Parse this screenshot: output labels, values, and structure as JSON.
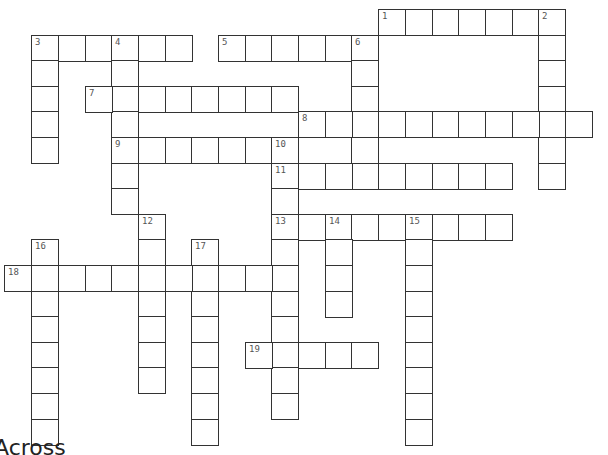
{
  "puzzle": {
    "layout": {
      "origin_x": 4.4,
      "origin_y": 9,
      "col_pitch": 26.7,
      "row_pitch": 25.6
    },
    "clues": [
      {
        "number": "1",
        "direction": "across",
        "row": 0,
        "col": 14,
        "length": 7
      },
      {
        "number": "2",
        "direction": "down",
        "row": 0,
        "col": 20,
        "length": 7
      },
      {
        "number": "3",
        "direction": "across",
        "row": 1,
        "col": 1,
        "length": 6
      },
      {
        "number": "3",
        "direction": "down",
        "row": 1,
        "col": 1,
        "length": 5
      },
      {
        "number": "4",
        "direction": "down",
        "row": 1,
        "col": 4,
        "length": 7
      },
      {
        "number": "5",
        "direction": "across",
        "row": 1,
        "col": 8,
        "length": 6
      },
      {
        "number": "6",
        "direction": "down",
        "row": 1,
        "col": 13,
        "length": 6
      },
      {
        "number": "7",
        "direction": "across",
        "row": 3,
        "col": 3,
        "length": 8
      },
      {
        "number": "8",
        "direction": "across",
        "row": 4,
        "col": 11,
        "length": 11
      },
      {
        "number": "9",
        "direction": "across",
        "row": 5,
        "col": 4,
        "length": 7
      },
      {
        "number": "10",
        "direction": "down",
        "row": 5,
        "col": 10,
        "length": 11
      },
      {
        "number": "11",
        "direction": "across",
        "row": 6,
        "col": 10,
        "length": 9
      },
      {
        "number": "12",
        "direction": "down",
        "row": 8,
        "col": 5,
        "length": 7
      },
      {
        "number": "13",
        "direction": "across",
        "row": 8,
        "col": 10,
        "length": 9
      },
      {
        "number": "14",
        "direction": "down",
        "row": 8,
        "col": 12,
        "length": 4
      },
      {
        "number": "15",
        "direction": "down",
        "row": 8,
        "col": 15,
        "length": 9
      },
      {
        "number": "16",
        "direction": "down",
        "row": 9,
        "col": 1,
        "length": 8
      },
      {
        "number": "17",
        "direction": "down",
        "row": 9,
        "col": 7,
        "length": 8
      },
      {
        "number": "18",
        "direction": "across",
        "row": 10,
        "col": 0,
        "length": 11
      },
      {
        "number": "19",
        "direction": "across",
        "row": 13,
        "col": 9,
        "length": 5
      }
    ]
  },
  "footer": {
    "heading": "Across"
  }
}
